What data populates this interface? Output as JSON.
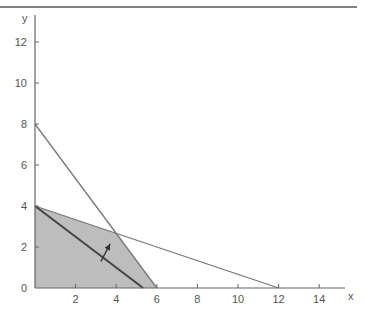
{
  "chart_data": {
    "type": "line",
    "title": "",
    "xlabel": "x",
    "ylabel": "y",
    "xlim": [
      0,
      15
    ],
    "ylim": [
      0,
      13
    ],
    "grid": false,
    "x_ticks": [
      2,
      4,
      6,
      8,
      10,
      12,
      14
    ],
    "y_ticks": [
      0,
      2,
      4,
      6,
      8,
      10,
      12
    ],
    "origin_label": "0",
    "series": [
      {
        "name": "constraint-1",
        "points": [
          [
            0,
            8
          ],
          [
            6,
            0
          ]
        ],
        "equation": "4x + 3y = 24"
      },
      {
        "name": "constraint-2",
        "points": [
          [
            0,
            4
          ],
          [
            12,
            0
          ]
        ],
        "equation": "x + 3y = 12"
      },
      {
        "name": "objective-line",
        "points": [
          [
            0,
            4
          ],
          [
            5.33,
            0
          ]
        ],
        "equation": "3x + 4y = 16"
      }
    ],
    "feasible_region": {
      "vertices": [
        [
          0,
          0
        ],
        [
          0,
          4
        ],
        [
          4,
          2.67
        ],
        [
          6,
          0
        ]
      ],
      "fill": "#bdbdbd"
    },
    "annotations": [
      {
        "type": "arrow",
        "from": [
          3.25,
          1.3
        ],
        "to": [
          3.7,
          2.15
        ],
        "meaning": "direction of improvement"
      }
    ]
  },
  "colors": {
    "axis": "#666666",
    "line": "#777777",
    "objective": "#444444",
    "region": "#bdbdbd",
    "rule": "#555555"
  }
}
